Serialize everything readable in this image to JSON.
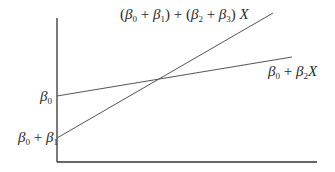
{
  "diagram": {
    "type": "interaction-regression-lines",
    "colors": {
      "axis": "#333333",
      "line": "#555555",
      "text": "#2a2a2a",
      "background": "#ffffff"
    },
    "axes": {
      "origin": [
        57,
        162
      ],
      "y_top": 18,
      "x_right": 317
    },
    "lines": [
      {
        "name": "steep-line",
        "from": [
          57,
          138
        ],
        "to": [
          273,
          13
        ],
        "label": {
          "open1": "(",
          "b0": "β",
          "s0": "0",
          "plus1": " + ",
          "b1": "β",
          "s1": "1",
          "close1": ")",
          "plus_mid": " + ",
          "open2": "(",
          "b2": "β",
          "s2": "2",
          "plus2": " + ",
          "b3": "β",
          "s3": "3",
          "close2": ")",
          "x": " X"
        }
      },
      {
        "name": "shallow-line",
        "from": [
          57,
          96
        ],
        "to": [
          292,
          57
        ],
        "label": {
          "b0": "β",
          "s0": "0",
          "plus": " + ",
          "b2": "β",
          "s2": "2",
          "x": "X"
        }
      }
    ],
    "y_labels": {
      "beta0": {
        "b": "β",
        "s": "0"
      },
      "beta0_plus_beta1": {
        "b0": "β",
        "s0": "0",
        "plus": " + ",
        "b1": "β",
        "s1": "1"
      }
    }
  }
}
